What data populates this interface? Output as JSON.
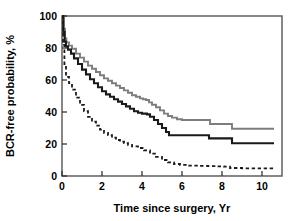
{
  "chart_data": {
    "type": "line",
    "title": "",
    "subtitle": "",
    "xlabel": "Time since surgery, Yr",
    "ylabel": "BCR-free probability, %",
    "xlim": [
      0,
      11
    ],
    "ylim": [
      0,
      100
    ],
    "xticks": [
      0,
      2,
      4,
      6,
      8,
      10
    ],
    "yticks": [
      0,
      20,
      40,
      60,
      80,
      100
    ],
    "xtick_labels": [
      "0",
      "2",
      "4",
      "6",
      "8",
      "10"
    ],
    "ytick_labels": [
      "0",
      "20",
      "40",
      "60",
      "80",
      "100"
    ],
    "grid": false,
    "legend": "none",
    "annotations": [],
    "series": [
      {
        "name": "gray-curve",
        "style": "solid",
        "color": "#7d7d7d",
        "width": 1.9,
        "points": [
          [
            0.0,
            100.0
          ],
          [
            0.08,
            92.0
          ],
          [
            0.15,
            86.0
          ],
          [
            0.22,
            83.5
          ],
          [
            0.35,
            81.5
          ],
          [
            0.5,
            79.5
          ],
          [
            0.7,
            76.5
          ],
          [
            0.9,
            74.0
          ],
          [
            1.1,
            71.5
          ],
          [
            1.3,
            69.0
          ],
          [
            1.5,
            67.0
          ],
          [
            1.7,
            65.0
          ],
          [
            1.9,
            63.0
          ],
          [
            2.1,
            61.0
          ],
          [
            2.3,
            59.5
          ],
          [
            2.5,
            58.0
          ],
          [
            2.7,
            56.5
          ],
          [
            2.9,
            55.0
          ],
          [
            3.1,
            53.5
          ],
          [
            3.3,
            52.0
          ],
          [
            3.5,
            50.5
          ],
          [
            3.7,
            49.5
          ],
          [
            3.9,
            48.5
          ],
          [
            4.05,
            48.0
          ],
          [
            4.2,
            47.5
          ],
          [
            4.35,
            46.0
          ],
          [
            4.5,
            44.5
          ],
          [
            4.7,
            43.0
          ],
          [
            4.9,
            41.0
          ],
          [
            5.1,
            39.0
          ],
          [
            5.3,
            37.5
          ],
          [
            5.5,
            36.5
          ],
          [
            5.75,
            35.5
          ],
          [
            6.0,
            35.0
          ],
          [
            6.5,
            35.0
          ],
          [
            7.0,
            35.0
          ],
          [
            7.35,
            35.0
          ],
          [
            7.4,
            32.5
          ],
          [
            8.0,
            32.5
          ],
          [
            8.45,
            32.5
          ],
          [
            8.5,
            29.5
          ],
          [
            9.5,
            29.5
          ],
          [
            10.6,
            29.5
          ]
        ]
      },
      {
        "name": "black-curve",
        "style": "solid",
        "color": "#1a1a1a",
        "width": 2.1,
        "points": [
          [
            0.0,
            100.0
          ],
          [
            0.07,
            90.0
          ],
          [
            0.13,
            84.0
          ],
          [
            0.2,
            81.0
          ],
          [
            0.3,
            79.0
          ],
          [
            0.45,
            76.5
          ],
          [
            0.6,
            73.5
          ],
          [
            0.8,
            70.0
          ],
          [
            1.0,
            66.5
          ],
          [
            1.2,
            63.5
          ],
          [
            1.4,
            60.5
          ],
          [
            1.6,
            58.0
          ],
          [
            1.8,
            55.5
          ],
          [
            2.0,
            53.0
          ],
          [
            2.2,
            51.0
          ],
          [
            2.4,
            49.5
          ],
          [
            2.6,
            48.0
          ],
          [
            2.8,
            46.5
          ],
          [
            3.0,
            45.0
          ],
          [
            3.2,
            43.5
          ],
          [
            3.4,
            42.0
          ],
          [
            3.6,
            40.5
          ],
          [
            3.8,
            39.5
          ],
          [
            4.0,
            39.0
          ],
          [
            4.25,
            38.5
          ],
          [
            4.4,
            37.0
          ],
          [
            4.6,
            35.0
          ],
          [
            4.8,
            32.5
          ],
          [
            5.0,
            30.0
          ],
          [
            5.2,
            27.5
          ],
          [
            5.35,
            25.5
          ],
          [
            5.6,
            25.5
          ],
          [
            6.0,
            25.5
          ],
          [
            6.5,
            25.5
          ],
          [
            7.0,
            25.5
          ],
          [
            7.3,
            25.5
          ],
          [
            7.35,
            23.5
          ],
          [
            8.0,
            23.5
          ],
          [
            8.45,
            23.5
          ],
          [
            8.5,
            20.5
          ],
          [
            9.5,
            20.5
          ],
          [
            10.6,
            20.5
          ]
        ]
      },
      {
        "name": "dashed-curve",
        "style": "dashed",
        "color": "#1a1a1a",
        "width": 1.8,
        "points": [
          [
            0.0,
            100.0
          ],
          [
            0.05,
            82.0
          ],
          [
            0.12,
            70.0
          ],
          [
            0.2,
            62.0
          ],
          [
            0.35,
            58.0
          ],
          [
            0.5,
            54.0
          ],
          [
            0.7,
            49.0
          ],
          [
            0.9,
            44.5
          ],
          [
            1.1,
            40.5
          ],
          [
            1.3,
            37.0
          ],
          [
            1.5,
            34.0
          ],
          [
            1.7,
            31.5
          ],
          [
            1.9,
            29.0
          ],
          [
            2.1,
            27.0
          ],
          [
            2.3,
            25.5
          ],
          [
            2.5,
            24.0
          ],
          [
            2.7,
            22.5
          ],
          [
            2.9,
            21.5
          ],
          [
            3.1,
            20.5
          ],
          [
            3.3,
            19.5
          ],
          [
            3.5,
            18.5
          ],
          [
            3.8,
            17.5
          ],
          [
            4.1,
            16.0
          ],
          [
            4.4,
            14.0
          ],
          [
            4.7,
            12.0
          ],
          [
            5.0,
            10.0
          ],
          [
            5.3,
            8.5
          ],
          [
            5.6,
            7.5
          ],
          [
            5.9,
            7.0
          ],
          [
            6.3,
            6.5
          ],
          [
            6.8,
            6.3
          ],
          [
            7.3,
            6.2
          ],
          [
            7.7,
            6.0
          ],
          [
            8.1,
            5.8
          ],
          [
            8.4,
            5.0
          ],
          [
            9.0,
            4.8
          ],
          [
            9.6,
            4.8
          ],
          [
            10.2,
            4.8
          ],
          [
            10.6,
            4.8
          ]
        ]
      }
    ]
  },
  "axes": {
    "frame_color": "#555555",
    "tick_color": "#333333"
  }
}
